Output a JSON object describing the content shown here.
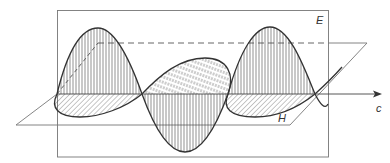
{
  "figure": {
    "labels": {
      "e_plane": "E",
      "h_plane": "H",
      "propagation": "c"
    },
    "colors": {
      "line": "#333333",
      "frame": "#777777",
      "background": "#ffffff"
    },
    "components": [
      {
        "name": "electric-field-wave",
        "plane": "vertical",
        "hatch": "vertical lines"
      },
      {
        "name": "magnetic-field-wave",
        "plane": "horizontal",
        "hatch": "diagonal lines"
      }
    ],
    "wave_periods_shown": 1.5
  }
}
